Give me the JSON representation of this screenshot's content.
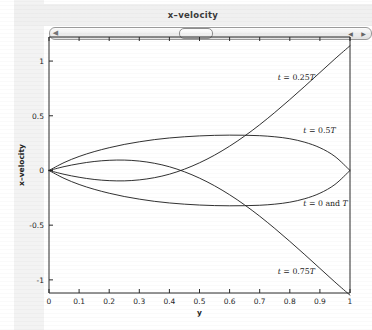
{
  "window": {
    "title": "x–velocity"
  },
  "scrollbar": {
    "left_arrow_icon": "triangle-left-icon",
    "right_arrow_icon": "triangle-right-icon",
    "thumb_name": "scrollbar-thumb",
    "position_percent": 45
  },
  "chart_data": {
    "type": "line",
    "title": "x–velocity",
    "xlabel": "y",
    "ylabel": "x–velocity",
    "xlim": [
      0,
      1
    ],
    "ylim": [
      -1.12,
      1.22
    ],
    "grid": false,
    "legend_position": "inline-annotations",
    "xticks": [
      "0",
      "0.1",
      "0.2",
      "0.3",
      "0.4",
      "0.5",
      "0.6",
      "0.7",
      "0.8",
      "0.9",
      "1"
    ],
    "xtick_values": [
      0,
      0.1,
      0.2,
      0.3,
      0.4,
      0.5,
      0.6,
      0.7,
      0.8,
      0.9,
      1
    ],
    "yticks": [
      "1",
      "0.5",
      "0",
      "-0.5",
      "-1"
    ],
    "ytick_values": [
      1,
      0.5,
      0,
      -0.5,
      -1
    ],
    "series": [
      {
        "name": "t = 0.25T",
        "label_html": "<tspan class=\"it\">t</tspan> = 0.25<tspan class=\"it\">T</tspan>",
        "label_x": 0.76,
        "label_y": 0.83,
        "x": [
          0,
          0.05,
          0.1,
          0.15,
          0.2,
          0.25,
          0.3,
          0.35,
          0.4,
          0.45,
          0.5,
          0.55,
          0.6,
          0.65,
          0.7,
          0.75,
          0.8,
          0.85,
          0.9,
          0.95,
          1.0
        ],
        "y": [
          0,
          -0.035,
          -0.062,
          -0.082,
          -0.093,
          -0.095,
          -0.086,
          -0.066,
          -0.034,
          0.012,
          0.07,
          0.14,
          0.222,
          0.315,
          0.418,
          0.53,
          0.648,
          0.77,
          0.895,
          1.02,
          1.14
        ]
      },
      {
        "name": "t = 0.5T",
        "label_html": "<tspan class=\"it\">t</tspan> = 0.5<tspan class=\"it\">T</tspan>",
        "label_x": 0.845,
        "label_y": 0.345,
        "x": [
          0,
          0.05,
          0.1,
          0.15,
          0.2,
          0.25,
          0.3,
          0.35,
          0.4,
          0.45,
          0.5,
          0.55,
          0.6,
          0.65,
          0.7,
          0.75,
          0.8,
          0.85,
          0.9,
          0.95,
          1.0
        ],
        "y": [
          0,
          0.072,
          0.128,
          0.172,
          0.208,
          0.238,
          0.262,
          0.282,
          0.297,
          0.308,
          0.316,
          0.321,
          0.323,
          0.322,
          0.318,
          0.308,
          0.29,
          0.258,
          0.208,
          0.128,
          0.0
        ]
      },
      {
        "name": "t = 0 and T",
        "label_html": "<tspan class=\"it\">t</tspan> = 0 and <tspan class=\"it\">T</tspan>",
        "label_x": 0.845,
        "label_y": -0.325,
        "x": [
          0,
          0.05,
          0.1,
          0.15,
          0.2,
          0.25,
          0.3,
          0.35,
          0.4,
          0.45,
          0.5,
          0.55,
          0.6,
          0.65,
          0.7,
          0.75,
          0.8,
          0.85,
          0.9,
          0.95,
          1.0
        ],
        "y": [
          0,
          -0.072,
          -0.128,
          -0.172,
          -0.208,
          -0.238,
          -0.262,
          -0.282,
          -0.297,
          -0.308,
          -0.316,
          -0.321,
          -0.323,
          -0.322,
          -0.318,
          -0.308,
          -0.29,
          -0.258,
          -0.208,
          -0.128,
          0.0
        ]
      },
      {
        "name": "t = 0.75T",
        "label_html": "<tspan class=\"it\">t</tspan> = 0.75<tspan class=\"it\">T</tspan>",
        "label_x": 0.76,
        "label_y": -0.945,
        "x": [
          0,
          0.05,
          0.1,
          0.15,
          0.2,
          0.25,
          0.3,
          0.35,
          0.4,
          0.45,
          0.5,
          0.55,
          0.6,
          0.65,
          0.7,
          0.75,
          0.8,
          0.85,
          0.9,
          0.95,
          1.0
        ],
        "y": [
          0,
          0.035,
          0.062,
          0.082,
          0.093,
          0.095,
          0.086,
          0.066,
          0.034,
          -0.012,
          -0.07,
          -0.14,
          -0.222,
          -0.315,
          -0.418,
          -0.53,
          -0.648,
          -0.77,
          -0.895,
          -1.02,
          -1.14
        ]
      }
    ]
  }
}
